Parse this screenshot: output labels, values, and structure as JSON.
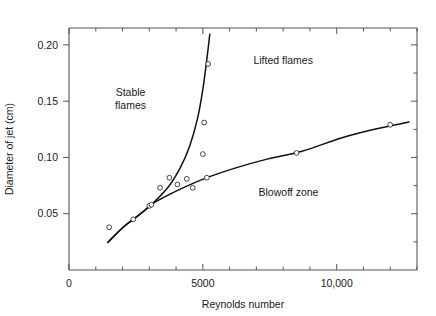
{
  "chart_data": {
    "type": "scatter",
    "title": "",
    "xlabel": "Reynolds number",
    "ylabel": "Diameter of jet (cm)",
    "xlim": [
      0,
      13000
    ],
    "ylim": [
      0,
      0.215
    ],
    "grid": false,
    "legend_position": "none",
    "x_tick_labels": [
      "0",
      "5000",
      "10,000"
    ],
    "x_tick_values": [
      0,
      5000,
      10000
    ],
    "x_minor_tick_step": 1000,
    "y_tick_labels": [
      "0.05",
      "0.10",
      "0.15",
      "0.20"
    ],
    "y_tick_values": [
      0.05,
      0.1,
      0.15,
      0.2
    ],
    "marker": "open-circle",
    "points": [
      {
        "x": 1500,
        "y": 0.038
      },
      {
        "x": 2400,
        "y": 0.045
      },
      {
        "x": 3000,
        "y": 0.057
      },
      {
        "x": 3080,
        "y": 0.058
      },
      {
        "x": 3400,
        "y": 0.073
      },
      {
        "x": 3750,
        "y": 0.082
      },
      {
        "x": 4050,
        "y": 0.076
      },
      {
        "x": 4400,
        "y": 0.081
      },
      {
        "x": 4620,
        "y": 0.073
      },
      {
        "x": 5150,
        "y": 0.082
      },
      {
        "x": 5000,
        "y": 0.103
      },
      {
        "x": 5050,
        "y": 0.131
      },
      {
        "x": 5200,
        "y": 0.183
      },
      {
        "x": 8500,
        "y": 0.104
      },
      {
        "x": 12000,
        "y": 0.129
      }
    ],
    "series": [
      {
        "name": "stability-boundary",
        "type": "line",
        "curve": [
          {
            "x": 1450,
            "y": 0.0245
          },
          {
            "x": 2000,
            "y": 0.0375
          },
          {
            "x": 2600,
            "y": 0.0485
          },
          {
            "x": 3100,
            "y": 0.0585
          },
          {
            "x": 3700,
            "y": 0.0735
          },
          {
            "x": 4150,
            "y": 0.0905
          },
          {
            "x": 4500,
            "y": 0.1095
          },
          {
            "x": 4800,
            "y": 0.1345
          },
          {
            "x": 5000,
            "y": 0.1605
          },
          {
            "x": 5150,
            "y": 0.1875
          },
          {
            "x": 5260,
            "y": 0.2095
          }
        ]
      },
      {
        "name": "blowoff-boundary",
        "type": "line",
        "curve": [
          {
            "x": 1450,
            "y": 0.0245
          },
          {
            "x": 2100,
            "y": 0.0395
          },
          {
            "x": 2700,
            "y": 0.0505
          },
          {
            "x": 3100,
            "y": 0.0585
          },
          {
            "x": 3700,
            "y": 0.0665
          },
          {
            "x": 4400,
            "y": 0.0745
          },
          {
            "x": 5200,
            "y": 0.0825
          },
          {
            "x": 6200,
            "y": 0.0905
          },
          {
            "x": 7400,
            "y": 0.0985
          },
          {
            "x": 8700,
            "y": 0.1055
          },
          {
            "x": 10200,
            "y": 0.1175
          },
          {
            "x": 11500,
            "y": 0.1255
          },
          {
            "x": 12700,
            "y": 0.1315
          }
        ]
      }
    ],
    "annotations": [
      {
        "name": "stable-flames",
        "lines": [
          "Stable",
          "flames"
        ],
        "x": 2300,
        "y": 0.155
      },
      {
        "name": "lifted-flames",
        "lines": [
          "Lifted flames"
        ],
        "x": 8000,
        "y": 0.183
      },
      {
        "name": "blowoff-zone",
        "lines": [
          "Blowoff zone"
        ],
        "x": 8200,
        "y": 0.066
      }
    ]
  },
  "style": {
    "axis_color": "#555555",
    "curve_color": "#111111",
    "marker_stroke": "#333333",
    "text_color": "#1a1a1a",
    "background": "#ffffff"
  }
}
